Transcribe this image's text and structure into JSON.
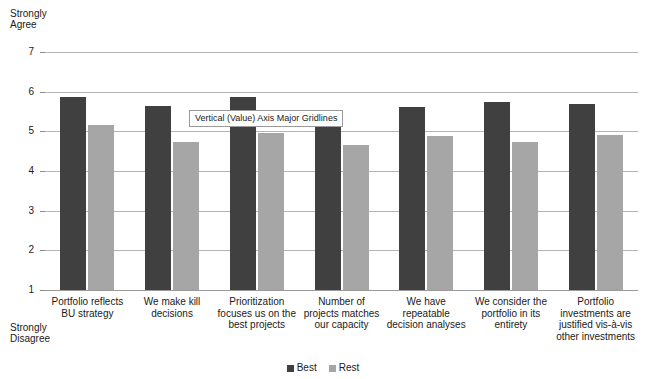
{
  "chart_data": {
    "type": "bar",
    "title": "",
    "subtitle": "",
    "xlabel": "",
    "ylabel": "",
    "ylim": [
      1,
      7
    ],
    "ytick_labels": [
      "1",
      "2",
      "3",
      "4",
      "5",
      "6",
      "7"
    ],
    "ytick_values": [
      1,
      2,
      3,
      4,
      5,
      6,
      7
    ],
    "grid": true,
    "grid_axis": "y",
    "legend_position": "bottom",
    "axis_top_caption": "Strongly\nAgree",
    "axis_bottom_caption": "Strongly\nDisagree",
    "categories": [
      "Portfolio reflects\nBU strategy",
      "We make kill\ndecisions",
      "Prioritization\nfocuses us on the\nbest projects",
      "Number of\nprojects matches\nour capacity",
      "We have\nrepeatable\ndecision analyses",
      "We consider the\nportfolio in its\nentirety",
      "Portfolio\ninvestments are\njustified vis-à-vis\nother investments"
    ],
    "series": [
      {
        "name": "Best",
        "color": "#404040",
        "values": [
          5.87,
          5.63,
          5.87,
          5.53,
          5.62,
          5.75,
          5.68
        ]
      },
      {
        "name": "Rest",
        "color": "#a6a6a6",
        "values": [
          5.15,
          4.72,
          4.97,
          4.65,
          4.87,
          4.73,
          4.9
        ]
      }
    ],
    "annotations": [
      {
        "name": "gridline-callout",
        "text": "Vertical (Value) Axis Major Gridlines"
      }
    ]
  },
  "legend": {
    "entries": [
      {
        "label": "Best",
        "color": "#404040"
      },
      {
        "label": "Rest",
        "color": "#a6a6a6"
      }
    ]
  }
}
